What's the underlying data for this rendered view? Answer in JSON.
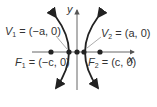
{
  "diagram": {
    "axes": {
      "x_label": "x",
      "y_label": "y"
    },
    "vertices": [
      {
        "name": "V1",
        "sub": "1",
        "coord": "(−a, 0)"
      },
      {
        "name": "V2",
        "sub": "2",
        "coord": "(a, 0)"
      }
    ],
    "foci": [
      {
        "name": "F1",
        "sub": "1",
        "coord": "(−c, 0)"
      },
      {
        "name": "F2",
        "sub": "2",
        "coord": "(c, 0)"
      }
    ],
    "colors": {
      "curve": "#222222",
      "axis": "#555555",
      "text": "#333333",
      "leader": "#888888"
    }
  }
}
